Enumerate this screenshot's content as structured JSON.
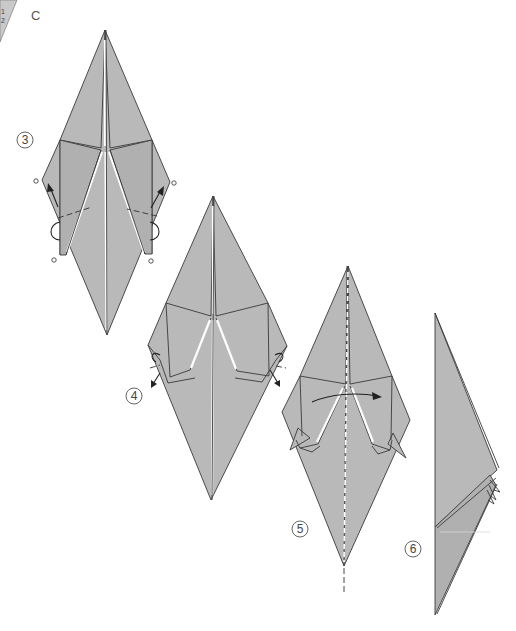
{
  "page": {
    "section_label": "C",
    "corner_tab_text": "1\n2",
    "colors": {
      "paper": "#b9b9b9",
      "line": "#3a3a3a",
      "background": "#ffffff"
    }
  },
  "steps": [
    {
      "number": "3",
      "description": "Inside-reverse fold both lower flaps up (marked with circles)"
    },
    {
      "number": "4",
      "description": "Inside-reverse fold the tips down"
    },
    {
      "number": "5",
      "description": "Fold in half along the center line"
    },
    {
      "number": "6",
      "description": "Folded result, side view"
    }
  ]
}
